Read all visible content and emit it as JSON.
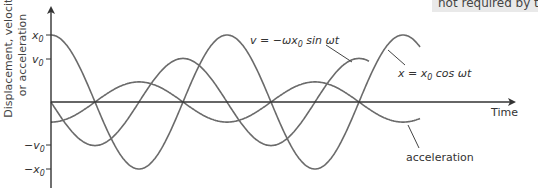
{
  "chart_data": {
    "type": "line",
    "title": "",
    "xlabel": "Time",
    "ylabel_lines": [
      "Displacement, velocity",
      "or acceleration"
    ],
    "ytick_labels": {
      "x0": "x0",
      "v0": "v0",
      "neg_v0": "−v0",
      "neg_x0": "−x0"
    },
    "yticks_relative": [
      1.0,
      0.65,
      -0.65,
      -1.0
    ],
    "grid": false,
    "legend": "inline annotations with leader lines",
    "series": [
      {
        "name": "displacement",
        "label": "x = x0 cos ωt",
        "function": "cos",
        "amplitude": 1.0,
        "phase_sign": 1,
        "cycles": 2.1
      },
      {
        "name": "velocity",
        "label": "v = −ωx0 sin ωt",
        "function": "-sin",
        "amplitude": 0.65,
        "cycles": 1.81
      },
      {
        "name": "acceleration",
        "label": "acceleration",
        "function": "-cos",
        "amplitude": 0.3,
        "cycles": 2.1
      }
    ],
    "x_range_periods": [
      0,
      2.1
    ],
    "y_range_relative": [
      -1.3,
      1.45
    ]
  },
  "labels": {
    "time": "Time",
    "velocity_eq_prefix": "v = −ωx",
    "velocity_eq_sub": "0",
    "velocity_eq_suffix": " sin ωt",
    "displacement_eq_prefix": "x = x",
    "displacement_eq_sub": "0",
    "displacement_eq_suffix": " cos ωt",
    "acceleration": "acceleration",
    "y_line1": "Displacement, velocity",
    "y_line2": "or acceleration",
    "tick_x0": "x",
    "tick_v0": "v",
    "tick_neg_v0": "−v",
    "tick_neg_x0": "−x",
    "tick_sub": "0"
  },
  "overlay_note": "not required by t",
  "colors": {
    "curve": "#6b6b6b",
    "axis": "#333333",
    "note_bg": "#e9e9e9"
  }
}
